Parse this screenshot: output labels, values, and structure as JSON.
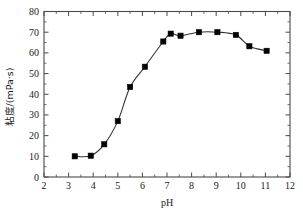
{
  "chart_data": {
    "type": "line",
    "title": "",
    "xlabel": "pH",
    "ylabel": "粘度/(mPa·s)",
    "xlim": [
      2,
      12
    ],
    "ylim": [
      0,
      80
    ],
    "xticks": [
      "2",
      "3",
      "4",
      "5",
      "6",
      "7",
      "8",
      "9",
      "10",
      "11",
      "12"
    ],
    "yticks": [
      "0",
      "10",
      "20",
      "30",
      "40",
      "50",
      "60",
      "70",
      "80"
    ],
    "xtick_values": [
      2,
      3,
      4,
      5,
      6,
      7,
      8,
      9,
      10,
      11,
      12
    ],
    "ytick_values": [
      0,
      10,
      20,
      30,
      40,
      50,
      60,
      70,
      80
    ],
    "minor_xticks": true,
    "minor_yticks": true,
    "grid": false,
    "legend": "none",
    "marker": "filled-square",
    "marker_color": "#000000",
    "line_color": "#333333",
    "x": [
      3.25,
      3.9,
      4.45,
      5.0,
      5.5,
      6.1,
      6.85,
      7.15,
      7.55,
      8.3,
      9.05,
      9.8,
      10.35,
      11.05
    ],
    "values": [
      10.0,
      10.3,
      15.8,
      27.0,
      43.5,
      53.3,
      65.5,
      69.3,
      68.3,
      70.0,
      70.0,
      68.7,
      63.2,
      61.0
    ],
    "series": [
      {
        "name": "viscosity",
        "x": [
          3.25,
          3.9,
          4.45,
          5.0,
          5.5,
          6.1,
          6.85,
          7.15,
          7.55,
          8.3,
          9.05,
          9.8,
          10.35,
          11.05
        ],
        "values": [
          10.0,
          10.3,
          15.8,
          27.0,
          43.5,
          53.3,
          65.5,
          69.3,
          68.3,
          70.0,
          70.0,
          68.7,
          63.2,
          61.0
        ]
      }
    ]
  },
  "axes": {
    "x_axis_title": "pH",
    "y_axis_title": "粘度/(mPa·s)"
  },
  "colors": {
    "background": "#ffffff",
    "frame": "#4a4a4a",
    "text": "#1a1a1a",
    "marker": "#000000",
    "line": "#333333"
  }
}
